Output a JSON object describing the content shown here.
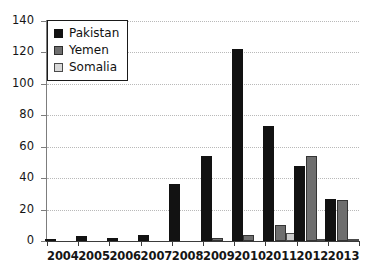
{
  "chart_data": {
    "type": "bar",
    "title": "",
    "subtitle": "",
    "xlabel": "",
    "ylabel": "",
    "categories": [
      "2004",
      "2005",
      "2006",
      "2007",
      "2008",
      "2009",
      "2010",
      "2011",
      "2012",
      "2013"
    ],
    "series": [
      {
        "name": "Pakistan",
        "color": "#121212",
        "values": [
          1,
          3,
          2,
          4,
          36,
          54,
          122,
          73,
          48,
          27
        ]
      },
      {
        "name": "Yemen",
        "color": "#6e6e6e",
        "values": [
          0,
          0,
          0,
          0,
          0,
          2,
          4,
          10,
          54,
          26
        ]
      },
      {
        "name": "Somalia",
        "color": "#cbcbcb",
        "values": [
          0,
          0,
          0,
          0,
          0,
          0,
          0,
          5,
          1.5,
          1
        ]
      }
    ],
    "ylim": [
      0,
      140
    ],
    "yticks": [
      0,
      20,
      40,
      60,
      80,
      100,
      120,
      140
    ],
    "ytick_labels": [
      "0",
      "20",
      "40",
      "60",
      "80",
      "100",
      "120",
      "140"
    ],
    "grid": true,
    "grid_style": "dotted-horizontal",
    "legend": {
      "position": "top-left",
      "entries": [
        {
          "label": "Pakistan",
          "swatch": "pakistan"
        },
        {
          "label": "Yemen",
          "swatch": "yemen"
        },
        {
          "label": "Somalia",
          "swatch": "somalia"
        }
      ]
    }
  }
}
